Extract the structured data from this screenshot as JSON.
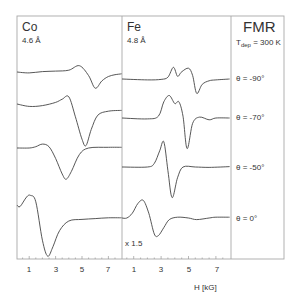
{
  "chart_data": {
    "type": "line",
    "title": "FMR",
    "subtitle": "T_dep = 300 K",
    "xlabel": "H [kG]",
    "ylabel": "",
    "xlim": [
      0,
      8
    ],
    "grid": false,
    "panels": [
      {
        "name": "Co",
        "thickness": "4.6 Å",
        "xticks": [
          1,
          3,
          5,
          7
        ],
        "series": [
          {
            "name": "θ = -90°",
            "x": [
              0,
              1,
              2,
              3,
              4,
              4.8,
              5.5,
              6,
              6.5,
              7,
              7.5,
              8
            ],
            "y": [
              0,
              -0.05,
              0.02,
              0.05,
              0.1,
              0.35,
              -0.2,
              -0.9,
              -0.5,
              -0.25,
              -0.15,
              -0.1
            ]
          },
          {
            "name": "θ = -70°",
            "x": [
              0,
              1,
              2,
              3,
              3.5,
              4,
              4.5,
              5,
              5.3,
              5.7,
              6.2,
              7,
              8
            ],
            "y": [
              0,
              -0.15,
              -0.1,
              0.1,
              0.3,
              0.45,
              -0.8,
              -2.2,
              -2.6,
              -1.6,
              -0.7,
              -0.45,
              -0.4
            ]
          },
          {
            "name": "θ = -50°",
            "x": [
              0,
              1,
              1.5,
              2,
              2.5,
              3,
              3.5,
              3.8,
              4.2,
              4.8,
              5.5,
              7,
              8
            ],
            "y": [
              0,
              0,
              0.1,
              0.3,
              0.1,
              -0.8,
              -2.0,
              -2.4,
              -1.8,
              -0.5,
              0,
              0.05,
              0.05
            ]
          },
          {
            "name": "θ = 0°",
            "x": [
              0,
              0.3,
              0.8,
              1.1,
              1.5,
              2,
              2.4,
              2.8,
              3.3,
              4,
              5,
              6,
              7,
              8
            ],
            "y": [
              0,
              -0.1,
              0.5,
              0.6,
              0.2,
              -2.2,
              -3.2,
              -2.6,
              -1.6,
              -1.0,
              -0.9,
              -0.85,
              -0.8,
              -0.8
            ]
          }
        ]
      },
      {
        "name": "Fe",
        "thickness": "4.8 Å",
        "xticks": [
          1,
          3,
          5,
          7
        ],
        "scale_note": "x 1.5",
        "series": [
          {
            "name": "θ = -90°",
            "x": [
              0,
              2,
              3,
              3.5,
              3.9,
              4.2,
              4.5,
              5,
              5.3,
              5.6,
              6,
              6.5,
              7,
              8
            ],
            "y": [
              0,
              -0.05,
              -0.02,
              0.1,
              0.65,
              0.15,
              0.4,
              0.6,
              0.2,
              -0.8,
              -0.3,
              -0.1,
              -0.05,
              0
            ]
          },
          {
            "name": "θ = -70°",
            "x": [
              0,
              2,
              2.8,
              3.2,
              3.6,
              4.0,
              4.3,
              4.6,
              4.9,
              5.3,
              5.8,
              6.5,
              7,
              8
            ],
            "y": [
              0,
              -0.05,
              0.1,
              0.9,
              1.25,
              0.8,
              0.9,
              0.1,
              -1.7,
              -0.3,
              0.05,
              -0.1,
              0,
              0
            ]
          },
          {
            "name": "θ = -50°",
            "x": [
              0,
              2,
              2.5,
              2.9,
              3.2,
              3.5,
              3.8,
              4.2,
              4.6,
              5.5,
              6.5,
              8
            ],
            "y": [
              0,
              0,
              0.2,
              0.9,
              1.4,
              -0.2,
              -1.7,
              -0.6,
              0,
              0,
              -0.02,
              0.02
            ]
          },
          {
            "name": "θ = 0°",
            "x": [
              0,
              0.5,
              0.9,
              1.3,
              1.7,
              2.1,
              2.5,
              2.8,
              3.2,
              3.6,
              4.2,
              5,
              5.6,
              6.5,
              7,
              8
            ],
            "y": [
              0,
              0,
              0.3,
              0.9,
              1.1,
              0.3,
              -1.0,
              -1.1,
              -0.6,
              -0.1,
              0.05,
              0.0,
              -0.1,
              0.0,
              0.05,
              0.05
            ]
          }
        ]
      }
    ],
    "annotations": [
      "θ = -90°",
      "θ = -70°",
      "θ = -50°",
      "θ = 0°",
      "x 1.5"
    ]
  },
  "labels": {
    "co": "Co",
    "co_thickness": "4.6 Å",
    "fe": "Fe",
    "fe_thickness": "4.8 Å",
    "fmr": "FMR",
    "tdep_T": "T",
    "tdep_sub": "dep",
    "tdep_value": " = 300 K",
    "theta": [
      "θ = -90°",
      "θ = -70°",
      "θ = -50°",
      "θ = 0°"
    ],
    "scale_note": "x 1.5",
    "xlabel": "H [kG]",
    "co_ticks": [
      "1",
      "3",
      "5",
      "7"
    ],
    "fe_ticks": [
      "1",
      "3",
      "5",
      "7"
    ]
  },
  "colors": {
    "frame": "#a8a8a8",
    "curve": "#444444",
    "text": "#333333"
  }
}
